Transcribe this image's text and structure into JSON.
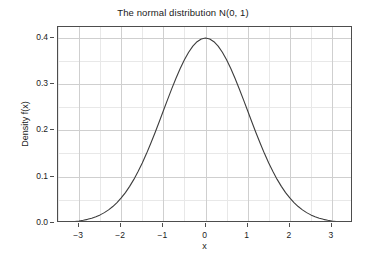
{
  "chart_data": {
    "type": "line",
    "title": "The normal distribution N(0, 1)",
    "xlabel": "x",
    "ylabel": "Density f(x)",
    "xlim": [
      -3.5,
      3.5
    ],
    "ylim": [
      0.0,
      0.4227
    ],
    "grid": true,
    "legend": null,
    "x_ticks": [
      -3,
      -2,
      -1,
      0,
      1,
      2,
      3
    ],
    "x_tick_labels": [
      "−3",
      "−2",
      "−1",
      "0",
      "1",
      "2",
      "3"
    ],
    "x_minor_ticks": [
      -3.5,
      -2.5,
      -1.5,
      -0.5,
      0.5,
      1.5,
      2.5,
      3.5
    ],
    "y_ticks": [
      0.0,
      0.1,
      0.2,
      0.3,
      0.4
    ],
    "y_tick_labels": [
      "0.0",
      "0.1",
      "0.2",
      "0.3",
      "0.4"
    ],
    "y_minor_ticks": [
      0.05,
      0.15,
      0.25,
      0.35
    ],
    "series": [
      {
        "name": "Standard normal density",
        "color": "#3d3d3d",
        "line_width": 1.1,
        "x": [
          -3.5,
          -3.4,
          -3.3,
          -3.2,
          -3.1,
          -3.0,
          -2.9,
          -2.8,
          -2.7,
          -2.6,
          -2.5,
          -2.4,
          -2.3,
          -2.2,
          -2.1,
          -2.0,
          -1.9,
          -1.8,
          -1.7,
          -1.6,
          -1.5,
          -1.4,
          -1.3,
          -1.2,
          -1.1,
          -1.0,
          -0.9,
          -0.8,
          -0.7,
          -0.6,
          -0.5,
          -0.4,
          -0.3,
          -0.2,
          -0.1,
          0.0,
          0.1,
          0.2,
          0.3,
          0.4,
          0.5,
          0.6,
          0.7,
          0.8,
          0.9,
          1.0,
          1.1,
          1.2,
          1.3,
          1.4,
          1.5,
          1.6,
          1.7,
          1.8,
          1.9,
          2.0,
          2.1,
          2.2,
          2.3,
          2.4,
          2.5,
          2.6,
          2.7,
          2.8,
          2.9,
          3.0,
          3.1,
          3.2,
          3.3,
          3.4,
          3.5
        ],
        "y": [
          0.0009,
          0.0012,
          0.0017,
          0.0024,
          0.0033,
          0.0044,
          0.006,
          0.0079,
          0.0104,
          0.0136,
          0.0175,
          0.0224,
          0.0283,
          0.0355,
          0.044,
          0.054,
          0.0656,
          0.079,
          0.094,
          0.1109,
          0.1295,
          0.1497,
          0.1714,
          0.1942,
          0.2179,
          0.242,
          0.2661,
          0.2897,
          0.3123,
          0.3332,
          0.3521,
          0.3683,
          0.3814,
          0.391,
          0.397,
          0.3989,
          0.397,
          0.391,
          0.3814,
          0.3683,
          0.3521,
          0.3332,
          0.3123,
          0.2897,
          0.2661,
          0.242,
          0.2179,
          0.1942,
          0.1714,
          0.1497,
          0.1295,
          0.1109,
          0.094,
          0.079,
          0.0656,
          0.054,
          0.044,
          0.0355,
          0.0283,
          0.0224,
          0.0175,
          0.0136,
          0.0104,
          0.0079,
          0.006,
          0.0044,
          0.0033,
          0.0024,
          0.0017,
          0.0012,
          0.0009
        ]
      }
    ],
    "annotations": [],
    "style": {
      "panel_background": "#ffffff",
      "panel_border": "#4d4d4d",
      "grid_major": "#cfcfcf",
      "grid_minor": "#e8e8e8",
      "figure_background": "#ffffff",
      "text_color": "#1a1a1a"
    }
  }
}
